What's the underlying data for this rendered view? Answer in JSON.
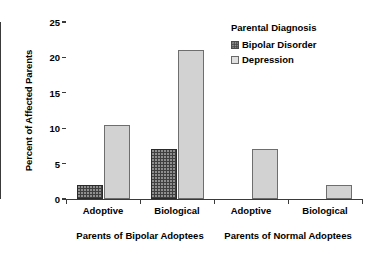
{
  "chart_data": {
    "type": "bar",
    "title": "",
    "xlabel": "",
    "ylabel": "Percent of Affected Parents",
    "ylim": [
      0,
      25
    ],
    "ytick_labels": [
      "25",
      "20",
      "15",
      "10",
      "5",
      "0"
    ],
    "ytick_values": [
      25,
      20,
      15,
      10,
      5,
      0
    ],
    "grid": false,
    "legend_position": "top-right",
    "legend_title": "Parental Diagnosis",
    "categories": [
      "Adoptive",
      "Biological",
      "Adoptive",
      "Biological"
    ],
    "groups": [
      {
        "label": "Parents of Bipolar Adoptees",
        "categories": [
          "Adoptive",
          "Biological"
        ]
      },
      {
        "label": "Parents of Normal Adoptees",
        "categories": [
          "Adoptive",
          "Biological"
        ]
      }
    ],
    "series": [
      {
        "name": "Bipolar Disorder",
        "color": "#3f3f3f",
        "values": [
          2.0,
          7.0,
          0,
          0
        ]
      },
      {
        "name": "Depression",
        "color": "#d2d2d2",
        "values": [
          10.5,
          21.0,
          7.0,
          2.0
        ]
      }
    ]
  },
  "axis": {
    "y_title": "Percent of Affected Parents",
    "y_ticks": [
      {
        "label": "25",
        "value": 25
      },
      {
        "label": "20",
        "value": 20
      },
      {
        "label": "15",
        "value": 15
      },
      {
        "label": "10",
        "value": 10
      },
      {
        "label": "5",
        "value": 5
      },
      {
        "label": "0",
        "value": 0
      }
    ]
  },
  "x_labels": {
    "cat": [
      "Adoptive",
      "Biological",
      "Adoptive",
      "Biological"
    ],
    "group": [
      "Parents of Bipolar Adoptees",
      "Parents of Normal Adoptees"
    ]
  },
  "legend": {
    "title": "Parental Diagnosis",
    "entries": [
      {
        "label": "Bipolar Disorder",
        "swatch": "bipolar"
      },
      {
        "label": "Depression",
        "swatch": "depression"
      }
    ]
  }
}
